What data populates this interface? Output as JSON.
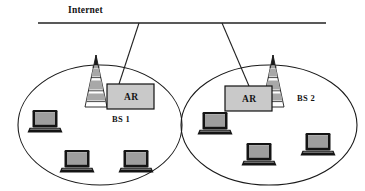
{
  "diagram": {
    "title": "Internet",
    "backbone": {
      "label": "Internet",
      "color": "#222222"
    },
    "cells": [
      {
        "id": "cell-1",
        "label": "BS 1",
        "router": {
          "label": "AR"
        },
        "tower": {
          "name": "base-station-tower"
        },
        "clients": [
          {
            "name": "laptop-1"
          },
          {
            "name": "laptop-2"
          },
          {
            "name": "laptop-3"
          }
        ]
      },
      {
        "id": "cell-2",
        "label": "BS 2",
        "router": {
          "label": "AR"
        },
        "tower": {
          "name": "base-station-tower"
        },
        "clients": [
          {
            "name": "laptop-4"
          },
          {
            "name": "laptop-5"
          },
          {
            "name": "laptop-6"
          }
        ]
      }
    ],
    "colors": {
      "line": "#222222",
      "ellipse": "#1a1a1a",
      "router_fill": "#c9c9c9",
      "tower_band": "#a8a8a8",
      "tower_white": "#ffffff",
      "laptop_body": "#141414",
      "laptop_screen": "#9e9e9e",
      "background": "#ffffff"
    }
  }
}
